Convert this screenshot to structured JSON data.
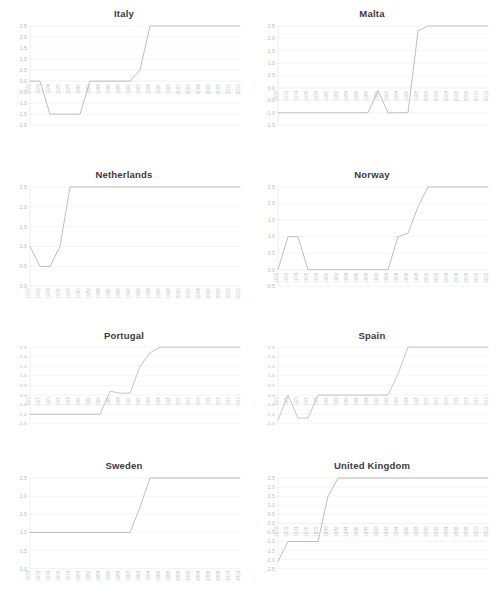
{
  "figure": {
    "layout": "2 columns x 4 rows of small-multiple line charts",
    "line_color": "#b6b6b6",
    "grid_color": "#ebebeb",
    "tick_color": "#c2c2c2"
  },
  "chart_data": [
    {
      "type": "line",
      "title": "Italy",
      "xlabel": "",
      "ylabel": "",
      "grid": true,
      "legend": "none",
      "xlim": [
        1970,
        2012
      ],
      "ylim": [
        -2.0,
        2.5
      ],
      "yticks": [
        -2.0,
        -1.5,
        -1.0,
        -0.5,
        0.0,
        0.5,
        1.0,
        1.5,
        2.0,
        2.5
      ],
      "ytick_labels": [
        "-2.0",
        "-1.5",
        "-1.0",
        "-0.5",
        "0.0",
        "0.5",
        "1.0",
        "1.5",
        "2.0",
        "2.5"
      ],
      "x": [
        1970,
        1972,
        1974,
        1976,
        1978,
        1980,
        1982,
        1984,
        1986,
        1988,
        1990,
        1992,
        1994,
        1996,
        1998,
        2000,
        2002,
        2004,
        2006,
        2008,
        2010,
        2012
      ],
      "xtick_labels": [
        "1970",
        "1972",
        "1974",
        "1976",
        "1978",
        "1980",
        "1982",
        "1984",
        "1986",
        "1988",
        "1990",
        "1992",
        "1994",
        "1996",
        "1998",
        "2000",
        "2002",
        "2004",
        "2006",
        "2008",
        "2010",
        "2012"
      ],
      "series": [
        {
          "name": "Italy",
          "values": [
            0.0,
            0.0,
            -1.5,
            -1.5,
            -1.5,
            -1.5,
            0.0,
            0.0,
            0.0,
            0.0,
            0.0,
            0.5,
            2.5,
            2.5,
            2.5,
            2.5,
            2.5,
            2.5,
            2.5,
            2.5,
            2.5,
            2.5
          ]
        }
      ]
    },
    {
      "type": "line",
      "title": "Malta",
      "xlabel": "",
      "ylabel": "",
      "grid": true,
      "legend": "none",
      "xlim": [
        1970,
        2012
      ],
      "ylim": [
        -1.5,
        2.5
      ],
      "yticks": [
        -1.5,
        -1.0,
        -0.5,
        0.0,
        0.5,
        1.0,
        1.5,
        2.0,
        2.5
      ],
      "ytick_labels": [
        "-1.5",
        "-1.0",
        "-0.5",
        "0.0",
        "0.5",
        "1.0",
        "1.5",
        "2.0",
        "2.5"
      ],
      "x": [
        1970,
        1972,
        1974,
        1976,
        1978,
        1980,
        1982,
        1984,
        1986,
        1988,
        1990,
        1992,
        1994,
        1996,
        1998,
        2000,
        2002,
        2004,
        2006,
        2008,
        2010,
        2012
      ],
      "xtick_labels": [
        "1970",
        "1972",
        "1974",
        "1976",
        "1978",
        "1980",
        "1982",
        "1984",
        "1986",
        "1988",
        "1990",
        "1992",
        "1994",
        "1996",
        "1998",
        "2000",
        "2002",
        "2004",
        "2006",
        "2008",
        "2010",
        "2012"
      ],
      "series": [
        {
          "name": "Malta",
          "values": [
            -1.0,
            -1.0,
            -1.0,
            -1.0,
            -1.0,
            -1.0,
            -1.0,
            -1.0,
            -1.0,
            -1.0,
            -0.1,
            -1.0,
            -1.0,
            -1.0,
            2.3,
            2.5,
            2.5,
            2.5,
            2.5,
            2.5,
            2.5,
            2.5
          ]
        }
      ]
    },
    {
      "type": "line",
      "title": "Netherlands",
      "xlabel": "",
      "ylabel": "",
      "grid": true,
      "legend": "none",
      "xlim": [
        1970,
        2012
      ],
      "ylim": [
        0.0,
        2.5
      ],
      "yticks": [
        0.0,
        0.5,
        1.0,
        1.5,
        2.0,
        2.5
      ],
      "ytick_labels": [
        "0.0",
        "0.5",
        "1.0",
        "1.5",
        "2.0",
        "2.5"
      ],
      "x": [
        1970,
        1972,
        1974,
        1976,
        1978,
        1980,
        1982,
        1984,
        1986,
        1988,
        1990,
        1992,
        1994,
        1996,
        1998,
        2000,
        2002,
        2004,
        2006,
        2008,
        2010,
        2012
      ],
      "xtick_labels": [
        "1970",
        "1972",
        "1974",
        "1976",
        "1978",
        "1980",
        "1982",
        "1984",
        "1986",
        "1988",
        "1990",
        "1992",
        "1994",
        "1996",
        "1998",
        "2000",
        "2002",
        "2004",
        "2006",
        "2008",
        "2010",
        "2012"
      ],
      "series": [
        {
          "name": "Netherlands",
          "values": [
            1.0,
            0.5,
            0.5,
            1.0,
            2.5,
            2.5,
            2.5,
            2.5,
            2.5,
            2.5,
            2.5,
            2.5,
            2.5,
            2.5,
            2.5,
            2.5,
            2.5,
            2.5,
            2.5,
            2.5,
            2.5,
            2.5
          ]
        }
      ]
    },
    {
      "type": "line",
      "title": "Norway",
      "xlabel": "",
      "ylabel": "",
      "grid": true,
      "legend": "none",
      "xlim": [
        1970,
        2012
      ],
      "ylim": [
        -0.5,
        2.5
      ],
      "yticks": [
        -0.5,
        0.0,
        0.5,
        1.0,
        1.5,
        2.0,
        2.5
      ],
      "ytick_labels": [
        "-0.5",
        "0.0",
        "0.5",
        "1.0",
        "1.5",
        "2.0",
        "2.5"
      ],
      "x": [
        1970,
        1972,
        1974,
        1976,
        1978,
        1980,
        1982,
        1984,
        1986,
        1988,
        1990,
        1992,
        1994,
        1996,
        1998,
        2000,
        2002,
        2004,
        2006,
        2008,
        2010,
        2012
      ],
      "xtick_labels": [
        "1970",
        "1972",
        "1974",
        "1976",
        "1978",
        "1980",
        "1982",
        "1984",
        "1986",
        "1988",
        "1990",
        "1992",
        "1994",
        "1996",
        "1998",
        "2000",
        "2002",
        "2004",
        "2006",
        "2008",
        "2010",
        "2012"
      ],
      "series": [
        {
          "name": "Norway",
          "values": [
            0.0,
            1.0,
            1.0,
            0.0,
            0.0,
            0.0,
            0.0,
            0.0,
            0.0,
            0.0,
            0.0,
            0.0,
            1.0,
            1.1,
            1.9,
            2.5,
            2.5,
            2.5,
            2.5,
            2.5,
            2.5,
            2.5
          ]
        }
      ]
    },
    {
      "type": "line",
      "title": "Portugal",
      "xlabel": "",
      "ylabel": "",
      "grid": true,
      "legend": "none",
      "xlim": [
        1970,
        2012
      ],
      "ylim": [
        -1.5,
        2.5
      ],
      "yticks": [
        -1.5,
        -1.0,
        -0.5,
        0.0,
        0.5,
        1.0,
        1.5,
        2.0,
        2.5
      ],
      "ytick_labels": [
        "-1.5",
        "-1.0",
        "-0.5",
        "0.0",
        "0.5",
        "1.0",
        "1.5",
        "2.0",
        "2.5"
      ],
      "x": [
        1970,
        1972,
        1974,
        1976,
        1978,
        1980,
        1982,
        1984,
        1986,
        1988,
        1990,
        1992,
        1994,
        1996,
        1998,
        2000,
        2002,
        2004,
        2006,
        2008,
        2010,
        2012
      ],
      "xtick_labels": [
        "1970",
        "1972",
        "1974",
        "1976",
        "1978",
        "1980",
        "1982",
        "1984",
        "1986",
        "1988",
        "1990",
        "1992",
        "1994",
        "1996",
        "1998",
        "2000",
        "2002",
        "2004",
        "2006",
        "2008",
        "2010",
        "2012"
      ],
      "series": [
        {
          "name": "Portugal",
          "values": [
            -1.0,
            -1.0,
            -1.0,
            -1.0,
            -1.0,
            -1.0,
            -1.0,
            -1.0,
            0.2,
            0.1,
            0.1,
            1.5,
            2.2,
            2.5,
            2.5,
            2.5,
            2.5,
            2.5,
            2.5,
            2.5,
            2.5,
            2.5
          ]
        }
      ]
    },
    {
      "type": "line",
      "title": "Spain",
      "xlabel": "",
      "ylabel": "",
      "grid": true,
      "legend": "none",
      "xlim": [
        1970,
        2012
      ],
      "ylim": [
        -1.5,
        2.5
      ],
      "yticks": [
        -1.5,
        -1.0,
        -0.5,
        0.0,
        0.5,
        1.0,
        1.5,
        2.0,
        2.5
      ],
      "ytick_labels": [
        "-1.5",
        "-1.0",
        "-0.5",
        "0.0",
        "0.5",
        "1.0",
        "1.5",
        "2.0",
        "2.5"
      ],
      "x": [
        1970,
        1972,
        1974,
        1976,
        1978,
        1980,
        1982,
        1984,
        1986,
        1988,
        1990,
        1992,
        1994,
        1996,
        1998,
        2000,
        2002,
        2004,
        2006,
        2008,
        2010,
        2012
      ],
      "xtick_labels": [
        "1970",
        "1972",
        "1974",
        "1976",
        "1978",
        "1980",
        "1982",
        "1984",
        "1986",
        "1988",
        "1990",
        "1992",
        "1994",
        "1996",
        "1998",
        "2000",
        "2002",
        "2004",
        "2006",
        "2008",
        "2010",
        "2012"
      ],
      "series": [
        {
          "name": "Spain",
          "values": [
            -1.3,
            0.0,
            -1.2,
            -1.2,
            0.0,
            0.0,
            0.0,
            0.0,
            0.0,
            0.0,
            0.0,
            0.0,
            1.1,
            2.5,
            2.5,
            2.5,
            2.5,
            2.5,
            2.5,
            2.5,
            2.5,
            2.5
          ]
        }
      ]
    },
    {
      "type": "line",
      "title": "Sweden",
      "xlabel": "",
      "ylabel": "",
      "grid": true,
      "legend": "none",
      "xlim": [
        1970,
        2012
      ],
      "ylim": [
        0.0,
        2.5
      ],
      "yticks": [
        0.0,
        0.5,
        1.0,
        1.5,
        2.0,
        2.5
      ],
      "ytick_labels": [
        "0.0",
        "0.5",
        "1.0",
        "1.5",
        "2.0",
        "2.5"
      ],
      "x": [
        1970,
        1972,
        1974,
        1976,
        1978,
        1980,
        1982,
        1984,
        1986,
        1988,
        1990,
        1992,
        1994,
        1996,
        1998,
        2000,
        2002,
        2004,
        2006,
        2008,
        2010,
        2012
      ],
      "xtick_labels": [
        "1970",
        "1972",
        "1974",
        "1976",
        "1978",
        "1980",
        "1982",
        "1984",
        "1986",
        "1988",
        "1990",
        "1992",
        "1994",
        "1996",
        "1998",
        "2000",
        "2002",
        "2004",
        "2006",
        "2008",
        "2010",
        "2012"
      ],
      "series": [
        {
          "name": "Sweden",
          "values": [
            1.0,
            1.0,
            1.0,
            1.0,
            1.0,
            1.0,
            1.0,
            1.0,
            1.0,
            1.0,
            1.0,
            1.7,
            2.5,
            2.5,
            2.5,
            2.5,
            2.5,
            2.5,
            2.5,
            2.5,
            2.5,
            2.5
          ]
        }
      ]
    },
    {
      "type": "line",
      "title": "United Kingdom",
      "xlabel": "",
      "ylabel": "",
      "grid": true,
      "legend": "none",
      "xlim": [
        1970,
        2012
      ],
      "ylim": [
        -2.5,
        2.5
      ],
      "yticks": [
        -2.5,
        -2.0,
        -1.5,
        -1.0,
        -0.5,
        0.0,
        0.5,
        1.0,
        1.5,
        2.0,
        2.5
      ],
      "ytick_labels": [
        "-2.5",
        "-2.0",
        "-1.5",
        "-1.0",
        "-0.5",
        "0.0",
        "0.5",
        "1.0",
        "1.5",
        "2.0",
        "2.5"
      ],
      "x": [
        1970,
        1972,
        1974,
        1976,
        1978,
        1980,
        1982,
        1984,
        1986,
        1988,
        1990,
        1992,
        1994,
        1996,
        1998,
        2000,
        2002,
        2004,
        2006,
        2008,
        2010,
        2012
      ],
      "xtick_labels": [
        "1970",
        "1972",
        "1974",
        "1976",
        "1978",
        "1980",
        "1982",
        "1984",
        "1986",
        "1988",
        "1990",
        "1992",
        "1994",
        "1996",
        "1998",
        "2000",
        "2002",
        "2004",
        "2006",
        "2008",
        "2010",
        "2012"
      ],
      "series": [
        {
          "name": "United Kingdom",
          "values": [
            -2.1,
            -1.0,
            -1.0,
            -1.0,
            -1.0,
            1.5,
            2.5,
            2.5,
            2.5,
            2.5,
            2.5,
            2.5,
            2.5,
            2.5,
            2.5,
            2.5,
            2.5,
            2.5,
            2.5,
            2.5,
            2.5,
            2.5
          ]
        }
      ]
    }
  ]
}
